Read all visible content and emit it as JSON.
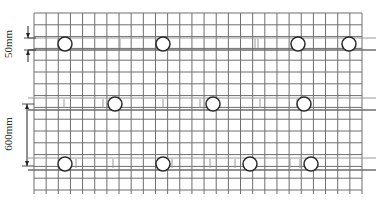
{
  "labels": {
    "spacing_small": "50mm",
    "spacing_large": "600mm"
  },
  "colors": {
    "grid": "#6e6e6e",
    "grid_light": "#9a9a9a",
    "circle": "#2a2a2a",
    "text": "#333333"
  },
  "grid": {
    "x0": 34,
    "x1": 362,
    "y0": 13,
    "y1": 190,
    "cols": 27,
    "rows": 15
  },
  "rows": [
    {
      "y": 44,
      "circles": [
        65,
        163,
        298,
        349
      ],
      "ticks": [
        58,
        120,
        157,
        255,
        258,
        295
      ]
    },
    {
      "y": 104,
      "circles": [
        115,
        213,
        304
      ],
      "ticks": [
        64,
        103,
        163,
        200,
        260,
        297
      ]
    },
    {
      "y": 164,
      "circles": [
        65,
        163,
        250,
        311
      ],
      "ticks": [
        76,
        113,
        172,
        210,
        235,
        290,
        300
      ]
    }
  ]
}
